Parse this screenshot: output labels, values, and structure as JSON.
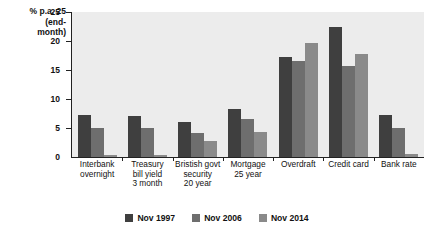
{
  "chart_data": {
    "type": "bar",
    "title": "",
    "xlabel": "",
    "ylabel": "% p.a. (end-month)",
    "ylabel_lines": [
      "% p.a. 25",
      "(end-",
      "month)"
    ],
    "ylim": [
      0,
      25
    ],
    "yticks": [
      0,
      5,
      10,
      15,
      20,
      25
    ],
    "ytick_labels": [
      "0",
      "5",
      "10",
      "15",
      "20",
      "25"
    ],
    "grid": false,
    "legend_position": "bottom",
    "categories": [
      "Interbank overnight",
      "Treasury bill yield 3 month",
      "Bristish govt security 20 year",
      "Mortgage 25 year",
      "Overdraft",
      "Credit card",
      "Bank rate"
    ],
    "category_lines": [
      [
        "Interbank",
        "overnight"
      ],
      [
        "Treasury",
        "bill yield",
        "3 month"
      ],
      [
        "Bristish govt",
        "security",
        "20 year"
      ],
      [
        "Mortgage",
        "25 year"
      ],
      [
        "Overdraft"
      ],
      [
        "Credit card"
      ],
      [
        "Bank rate"
      ]
    ],
    "series": [
      {
        "name": "Nov 1997",
        "color": "#3f3f3f",
        "values": [
          7.3,
          7.0,
          6.1,
          8.2,
          17.3,
          22.5,
          7.2
        ]
      },
      {
        "name": "Nov 2006",
        "color": "#6e6e6e",
        "values": [
          5.0,
          5.0,
          4.1,
          6.5,
          16.5,
          15.7,
          5.0
        ]
      },
      {
        "name": "Nov 2014",
        "color": "#8a8a8a",
        "values": [
          0.4,
          0.4,
          2.7,
          4.3,
          19.7,
          17.7,
          0.5
        ]
      }
    ]
  },
  "legend": {
    "items": [
      {
        "label": "Nov 1997",
        "color": "#3f3f3f"
      },
      {
        "label": "Nov 2006",
        "color": "#6e6e6e"
      },
      {
        "label": "Nov 2014",
        "color": "#8a8a8a"
      }
    ]
  }
}
